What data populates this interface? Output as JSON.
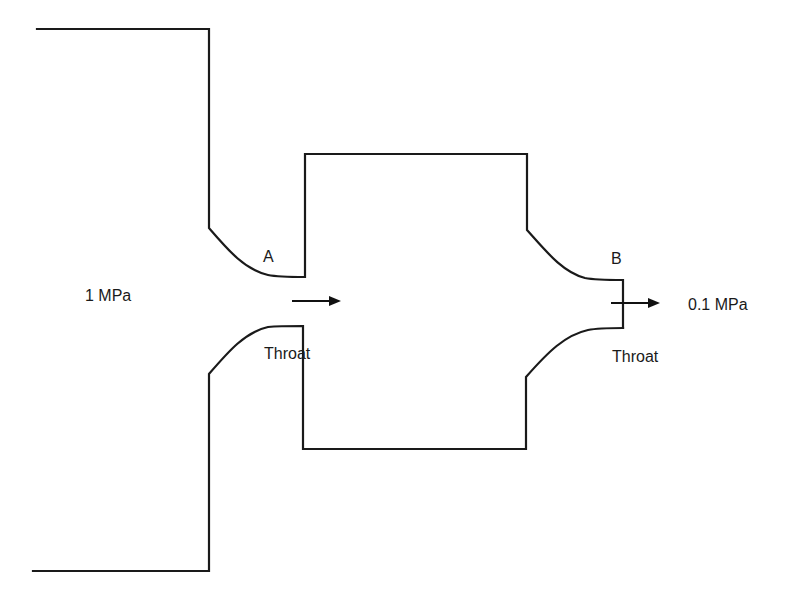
{
  "diagram": {
    "type": "converging-nozzle-series",
    "labels": {
      "inlet_pressure": "1 MPa",
      "outlet_pressure": "0.1 MPa",
      "nozzle_a": "A",
      "nozzle_b": "B",
      "throat_a": "Throat",
      "throat_b": "Throat"
    },
    "colors": {
      "stroke": "#1a1a1a",
      "background": "#ffffff"
    },
    "flow_arrows": [
      {
        "name": "flow-arrow-throat-a",
        "x1": 292,
        "y1": 301,
        "x2": 341,
        "y2": 301
      },
      {
        "name": "flow-arrow-throat-b",
        "x1": 611,
        "y1": 303,
        "x2": 660,
        "y2": 303
      }
    ]
  }
}
